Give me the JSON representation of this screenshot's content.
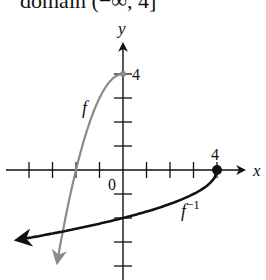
{
  "caption": "domain (−∞, 4]",
  "chart_data": {
    "type": "line",
    "title": "domain (−∞, 4]",
    "xlabel": "x",
    "ylabel": "y",
    "grid": false,
    "xlim": [
      -5,
      5
    ],
    "ylim": [
      -4.5,
      4.5
    ],
    "tick_labels": {
      "x": [
        "0",
        "4"
      ],
      "y": [
        "4"
      ]
    },
    "x_ticks": [
      -4,
      -3,
      -2,
      -1,
      1,
      2,
      3,
      4
    ],
    "y_ticks": [
      -4,
      -3,
      -2,
      -1,
      1,
      2,
      3,
      4
    ],
    "series": [
      {
        "name": "f",
        "label": "f",
        "color": "#8a8a8a",
        "formula": "y = 4 - x^2, x <= 0",
        "x": [
          0,
          -0.5,
          -1,
          -1.5,
          -2,
          -2.5,
          -2.8
        ],
        "values": [
          4,
          3.75,
          3,
          1.75,
          0,
          -2.25,
          -3.84
        ]
      },
      {
        "name": "f^-1",
        "label": "f⁻¹",
        "color": "#111111",
        "formula": "y = -sqrt(4 - x), x <= 4",
        "x": [
          4,
          3,
          2,
          0,
          -2,
          -4.5
        ],
        "values": [
          0,
          -1,
          -1.41,
          -2,
          -2.45,
          -2.92
        ]
      }
    ],
    "annotations": [
      {
        "text": "4",
        "at": [
          0,
          4
        ],
        "note": "endpoint of f at (0,4)"
      },
      {
        "text": "4",
        "at": [
          4,
          0
        ],
        "note": "endpoint of f^-1 at (4,0), filled dot"
      }
    ]
  },
  "labels": {
    "x_axis": "x",
    "y_axis": "y",
    "origin": "0",
    "y_four": "4",
    "x_four": "4",
    "f": "f",
    "f_inv_base": "f",
    "f_inv_sup": "−1"
  }
}
